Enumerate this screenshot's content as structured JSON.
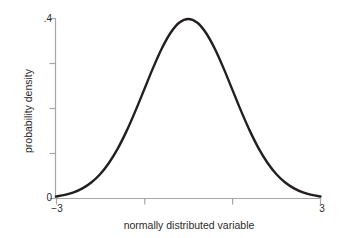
{
  "chart_data": {
    "type": "line",
    "title": "",
    "subtitle": "",
    "xlabel": "normally distributed variable",
    "ylabel": "probability density",
    "xlim": [
      -3,
      3
    ],
    "ylim": [
      0,
      0.4
    ],
    "grid": false,
    "legend": null,
    "legend_position": "none",
    "x_tick_values": [
      -3,
      -1,
      1,
      3
    ],
    "x_tick_labels": [
      "−3",
      "",
      "",
      "3"
    ],
    "y_tick_values": [
      0,
      0.1,
      0.2,
      0.3,
      0.4
    ],
    "y_tick_labels": [
      "0",
      "",
      "",
      "",
      ".4"
    ],
    "series": [
      {
        "name": "standard normal density",
        "formula": "phi(x) = (1/sqrt(2*pi)) * exp(-x^2/2)",
        "color": "#231f20",
        "linewidth": 2.4,
        "x": [
          -3,
          -2.8,
          -2.6,
          -2.4,
          -2.2,
          -2,
          -1.8,
          -1.6,
          -1.4,
          -1.2,
          -1,
          -0.8,
          -0.6,
          -0.4,
          -0.2,
          0,
          0.2,
          0.4,
          0.6,
          0.8,
          1,
          1.2,
          1.4,
          1.6,
          1.8,
          2,
          2.2,
          2.4,
          2.6,
          2.8,
          3
        ],
        "y": [
          0.0044,
          0.0079,
          0.0136,
          0.0224,
          0.0355,
          0.054,
          0.079,
          0.1109,
          0.1497,
          0.1942,
          0.242,
          0.2897,
          0.3332,
          0.3683,
          0.391,
          0.3989,
          0.391,
          0.3683,
          0.3332,
          0.2897,
          0.242,
          0.1942,
          0.1497,
          0.1109,
          0.079,
          0.054,
          0.0355,
          0.0224,
          0.0136,
          0.0079,
          0.0044
        ]
      }
    ],
    "colors": {
      "curve": "#231f20",
      "axis": "#a6a6a6",
      "text": "#2b2b2b",
      "background": "#ffffff"
    }
  },
  "axes": {
    "y_label_top": ".4",
    "y_label_bottom": "0",
    "x_label_left": "−3",
    "x_label_right": "3",
    "x_title": "normally distributed variable",
    "y_title": "probability density"
  }
}
